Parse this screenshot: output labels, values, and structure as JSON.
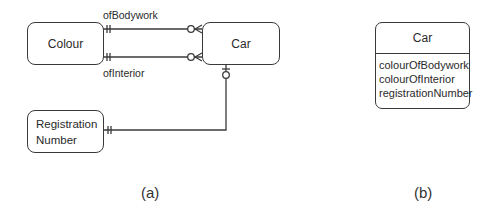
{
  "diagram_a": {
    "caption": "(a)",
    "entities": [
      {
        "id": "colour",
        "label": "Colour"
      },
      {
        "id": "car",
        "label": "Car"
      },
      {
        "id": "registration_number",
        "label_lines": [
          "Registration",
          "Number"
        ]
      }
    ],
    "relationships": [
      {
        "label": "ofBodywork",
        "from": "Colour",
        "to": "Car",
        "from_cardinality": "exactly-one",
        "to_cardinality": "zero-or-many"
      },
      {
        "label": "ofInterior",
        "from": "Colour",
        "to": "Car",
        "from_cardinality": "exactly-one",
        "to_cardinality": "zero-or-many"
      },
      {
        "label": "",
        "from": "Registration Number",
        "to": "Car",
        "from_cardinality": "exactly-one",
        "to_cardinality": "zero-or-one"
      }
    ]
  },
  "diagram_b": {
    "caption": "(b)",
    "class_name": "Car",
    "attributes": [
      "colourOfBodywork",
      "colourOfInterior",
      "registrationNumber"
    ]
  },
  "colors": {
    "line": "#3a3a3a",
    "text": "#2a2a2a",
    "background": "#ffffff"
  }
}
